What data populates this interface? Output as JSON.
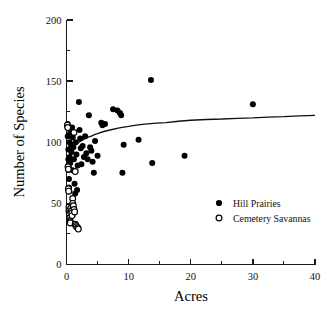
{
  "chart_data": {
    "type": "scatter",
    "title": "",
    "xlabel": "Acres",
    "ylabel": "Number of Species",
    "xlim": [
      0,
      40
    ],
    "ylim": [
      0,
      200
    ],
    "xticks": [
      0,
      10,
      20,
      30,
      40
    ],
    "xticklabels": [
      "0",
      "10",
      "20",
      "30",
      "40"
    ],
    "xminorticks": [
      5,
      15,
      25,
      35
    ],
    "yticks": [
      0,
      50,
      100,
      150,
      200
    ],
    "yticklabels": [
      "0",
      "50",
      "100",
      "150",
      "200"
    ],
    "yminorticks": [
      25,
      75,
      125,
      175
    ],
    "grid": false,
    "legend_position": "center-right",
    "legend": [
      {
        "name": "Hill Prairies",
        "marker": "filled-circle",
        "color": "#000000"
      },
      {
        "name": "Cemetery Savannas",
        "marker": "open-circle",
        "color": "#000000"
      }
    ],
    "series": [
      {
        "name": "Hill Prairies",
        "marker": "filled-circle",
        "points": [
          [
            0.2,
            115
          ],
          [
            0.2,
            105
          ],
          [
            0.3,
            94
          ],
          [
            0.3,
            86
          ],
          [
            0.35,
            80
          ],
          [
            0.4,
            70
          ],
          [
            0.4,
            63
          ],
          [
            0.45,
            60
          ],
          [
            0.5,
            100
          ],
          [
            0.5,
            88
          ],
          [
            0.6,
            108
          ],
          [
            0.6,
            83
          ],
          [
            0.7,
            98
          ],
          [
            0.8,
            92
          ],
          [
            0.9,
            112
          ],
          [
            1.0,
            104
          ],
          [
            1.0,
            77
          ],
          [
            1.1,
            96
          ],
          [
            1.2,
            86
          ],
          [
            1.3,
            66
          ],
          [
            1.4,
            58
          ],
          [
            1.5,
            100
          ],
          [
            1.6,
            90
          ],
          [
            1.7,
            61
          ],
          [
            1.8,
            81
          ],
          [
            2.0,
            133
          ],
          [
            2.1,
            110
          ],
          [
            2.2,
            103
          ],
          [
            2.3,
            95
          ],
          [
            2.4,
            82
          ],
          [
            2.6,
            97
          ],
          [
            2.8,
            88
          ],
          [
            3.0,
            105
          ],
          [
            3.2,
            91
          ],
          [
            3.4,
            86
          ],
          [
            3.6,
            122
          ],
          [
            3.8,
            96
          ],
          [
            4.0,
            93
          ],
          [
            4.2,
            84
          ],
          [
            4.4,
            75
          ],
          [
            4.6,
            101
          ],
          [
            5.0,
            89
          ],
          [
            5.6,
            116
          ],
          [
            5.8,
            114
          ],
          [
            6.2,
            115
          ],
          [
            7.5,
            127
          ],
          [
            8.2,
            126
          ],
          [
            8.6,
            124
          ],
          [
            8.8,
            122
          ],
          [
            9.0,
            75
          ],
          [
            9.2,
            98
          ],
          [
            11.6,
            102
          ],
          [
            13.6,
            151
          ],
          [
            13.8,
            83
          ],
          [
            19.0,
            89
          ],
          [
            30.0,
            131
          ]
        ]
      },
      {
        "name": "Cemetery Savannas",
        "marker": "open-circle",
        "points": [
          [
            0.15,
            114
          ],
          [
            0.2,
            112
          ],
          [
            0.25,
            80
          ],
          [
            0.3,
            78
          ],
          [
            0.3,
            62
          ],
          [
            0.35,
            60
          ],
          [
            0.4,
            47
          ],
          [
            0.4,
            44
          ],
          [
            0.45,
            42
          ],
          [
            0.5,
            41
          ],
          [
            0.5,
            38
          ],
          [
            0.55,
            36
          ],
          [
            0.6,
            35
          ],
          [
            0.6,
            34
          ],
          [
            0.7,
            46
          ],
          [
            0.8,
            44
          ],
          [
            0.85,
            42
          ],
          [
            0.9,
            40
          ],
          [
            1.0,
            54
          ],
          [
            1.0,
            50
          ],
          [
            1.1,
            48
          ],
          [
            1.2,
            45
          ],
          [
            1.3,
            43
          ],
          [
            1.4,
            33
          ],
          [
            1.5,
            32
          ],
          [
            1.6,
            31
          ],
          [
            1.8,
            30
          ],
          [
            1.9,
            29
          ],
          [
            1.2,
            108
          ],
          [
            1.4,
            76
          ]
        ]
      }
    ],
    "fit_curve": {
      "name": "logarithmic fit",
      "points": [
        [
          0.0,
          78
        ],
        [
          0.2,
          84
        ],
        [
          0.4,
          88
        ],
        [
          0.7,
          92
        ],
        [
          1.0,
          95
        ],
        [
          1.5,
          98
        ],
        [
          2.0,
          100
        ],
        [
          3.0,
          103
        ],
        [
          4.0,
          105
        ],
        [
          5.0,
          107
        ],
        [
          7.0,
          110
        ],
        [
          10.0,
          113
        ],
        [
          13.0,
          115
        ],
        [
          16.0,
          116
        ],
        [
          20.0,
          118
        ],
        [
          25.0,
          119
        ],
        [
          30.0,
          120
        ],
        [
          35.0,
          121
        ],
        [
          40.0,
          122
        ]
      ]
    }
  }
}
